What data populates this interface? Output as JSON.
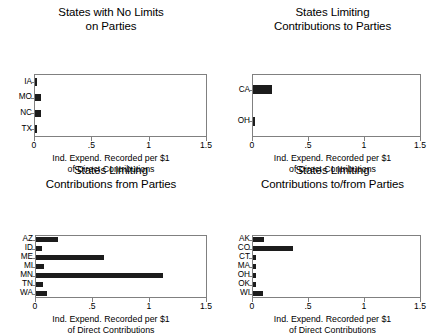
{
  "figure": {
    "background": "#ffffff",
    "bar_color": "#1c1c1c",
    "frame_color": "#808080"
  },
  "axis_common": {
    "xlabel": "Ind. Expend. Recorded per $1\nof Direct Contributions",
    "xticklabels": [
      "0",
      ".5",
      "1",
      "1.5"
    ],
    "xtickvalues": [
      0,
      0.5,
      1,
      1.5
    ],
    "xlim": [
      0,
      1.5
    ]
  },
  "panels": [
    {
      "key": "no-limits-on-parties",
      "title": "States with No Limits\non Parties",
      "categories": [
        "IA",
        "MO",
        "NC",
        "TX"
      ],
      "values": [
        0.005,
        0.05,
        0.05,
        0.005
      ]
    },
    {
      "key": "limiting-contributions-to-parties",
      "title": "States Limiting\nContributions to Parties",
      "categories": [
        "CA",
        "OH"
      ],
      "values": [
        0.17,
        0.005
      ]
    },
    {
      "key": "limiting-contributions-from-parties",
      "title": "States Limiting\nContributions from Parties",
      "categories": [
        "AZ",
        "ID",
        "ME",
        "MI",
        "MN",
        "TN",
        "WA"
      ],
      "values": [
        0.19,
        0.05,
        0.6,
        0.07,
        1.12,
        0.06,
        0.1
      ]
    },
    {
      "key": "limiting-contributions-to-from-parties",
      "title": "States Limiting\nContributions to/from Parties",
      "categories": [
        "AK",
        "CO",
        "CT",
        "MA",
        "OH",
        "OK",
        "WI"
      ],
      "values": [
        0.1,
        0.36,
        0.025,
        0.025,
        0.025,
        0.025,
        0.09
      ]
    }
  ],
  "chart_data": {
    "type": "bar",
    "orientation": "horizontal",
    "subplots": 4,
    "layout": "2x2",
    "grid": false,
    "legend": null,
    "shared_xlabel": "Ind. Expend. Recorded per $1 of Direct Contributions",
    "xlim": [
      0,
      1.5
    ],
    "xticks": [
      0,
      0.5,
      1,
      1.5
    ],
    "xticklabels": [
      "0",
      ".5",
      "1",
      "1.5"
    ],
    "charts": [
      {
        "title": "States with No Limits on Parties",
        "categories": [
          "IA",
          "MO",
          "NC",
          "TX"
        ],
        "values": [
          0.005,
          0.05,
          0.05,
          0.005
        ],
        "xlabel": "Ind. Expend. Recorded per $1 of Direct Contributions",
        "ylabel": ""
      },
      {
        "title": "States Limiting Contributions to Parties",
        "categories": [
          "CA",
          "OH"
        ],
        "values": [
          0.17,
          0.005
        ],
        "xlabel": "Ind. Expend. Recorded per $1 of Direct Contributions",
        "ylabel": ""
      },
      {
        "title": "States Limiting Contributions from Parties",
        "categories": [
          "AZ",
          "ID",
          "ME",
          "MI",
          "MN",
          "TN",
          "WA"
        ],
        "values": [
          0.19,
          0.05,
          0.6,
          0.07,
          1.12,
          0.06,
          0.1
        ],
        "xlabel": "Ind. Expend. Recorded per $1 of Direct Contributions",
        "ylabel": ""
      },
      {
        "title": "States Limiting Contributions to/from Parties",
        "categories": [
          "AK",
          "CO",
          "CT",
          "MA",
          "OH",
          "OK",
          "WI"
        ],
        "values": [
          0.1,
          0.36,
          0.025,
          0.025,
          0.025,
          0.025,
          0.09
        ],
        "xlabel": "Ind. Expend. Recorded per $1 of Direct Contributions",
        "ylabel": ""
      }
    ]
  }
}
